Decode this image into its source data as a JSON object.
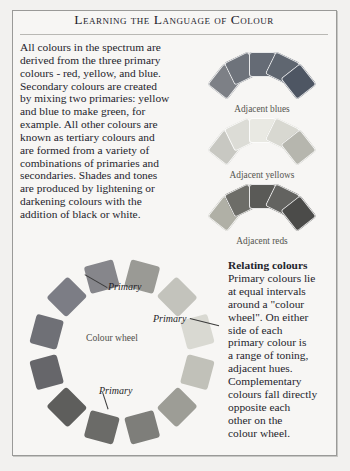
{
  "page": {
    "title": "Learning the Language of Colour",
    "background_color": "#f2f1ef",
    "frame_color": "#9a9a98"
  },
  "body_copy": {
    "lines": [
      "All colours in the spectrum are",
      "derived from the three primary",
      "colours - red, yellow, and blue.",
      "Secondary colours are created",
      "by mixing two primaries: yellow",
      "and blue to make green, for",
      "example. All other colours are",
      "known as tertiary colours and",
      "are formed from a variety of",
      "combinations of primaries and",
      "secondaries. Shades and tones",
      "are produced by lightening or",
      "darkening colours with the",
      "addition of black or white."
    ]
  },
  "relating": {
    "heading": "Relating colours",
    "lines": [
      "Primary colours lie",
      "at equal intervals",
      "around a \"colour",
      "wheel\". On either",
      "side of each",
      "primary colour is",
      "a range of toning,",
      "adjacent hues.",
      "Complementary",
      "colours fall directly",
      "opposite each",
      "other on the",
      "colour wheel."
    ]
  },
  "arcs": [
    {
      "id": "adjacent-blues",
      "caption": "Adjacent blues",
      "swatches": [
        "#7d8086",
        "#6e737b",
        "#656b75",
        "#5f6670",
        "#4e5663"
      ]
    },
    {
      "id": "adjacent-yellows",
      "caption": "Adjacent yellows",
      "swatches": [
        "#c8c8c2",
        "#dcdcd6",
        "#e9e9e3",
        "#d8d8d1",
        "#b6b6ae"
      ]
    },
    {
      "id": "adjacent-reds",
      "caption": "Adjacent reds",
      "swatches": [
        "#b0b0a6",
        "#6d6d68",
        "#5a5a57",
        "#636360",
        "#4b4b49"
      ]
    }
  ],
  "wheel": {
    "center_label": "Colour wheel",
    "primary_label": "Primary",
    "swatch_count": 12,
    "swatches": [
      "#9a9a95",
      "#c3c3bc",
      "#d9d9d2",
      "#c1c1b9",
      "#9d9d96",
      "#7e7e7a",
      "#6b6b68",
      "#5e5e5c",
      "#66666a",
      "#6f7076",
      "#7c7d85",
      "#86868b"
    ]
  }
}
